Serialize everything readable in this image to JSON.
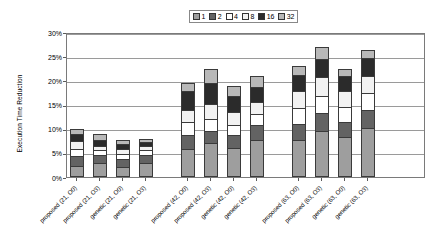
{
  "chart_data": {
    "type": "bar",
    "subtype": "stacked-bar",
    "title": "",
    "xlabel": "",
    "ylabel": "Execution Time Reduction",
    "ylim": [
      0,
      30
    ],
    "ytick_labels": [
      "0%",
      "5%",
      "10%",
      "15%",
      "20%",
      "25%",
      "30%"
    ],
    "ytick_values": [
      0,
      5,
      10,
      15,
      20,
      25,
      30
    ],
    "grid": true,
    "legend_position": "top-center",
    "legend_title": "",
    "series": [
      {
        "name": "1",
        "color": "#9e9e9e",
        "values": [
          2.2,
          3.0,
          2.1,
          2.9,
          5.8,
          7.0,
          6.1,
          7.7,
          7.7,
          9.6,
          8.2,
          10.2
        ]
      },
      {
        "name": "2",
        "color": "#636363",
        "values": [
          2.1,
          1.5,
          1.7,
          1.6,
          2.9,
          2.5,
          2.6,
          3.1,
          3.3,
          3.6,
          3.2,
          3.6
        ]
      },
      {
        "name": "4",
        "color": "#ffffff",
        "values": [
          1.6,
          1.0,
          1.0,
          1.0,
          2.7,
          2.5,
          2.1,
          2.3,
          3.3,
          3.6,
          3.0,
          3.5
        ]
      },
      {
        "name": "8",
        "color": "#f2f2f2",
        "values": [
          1.5,
          1.0,
          1.0,
          0.9,
          2.5,
          3.1,
          2.6,
          2.5,
          3.5,
          3.9,
          3.3,
          3.6
        ]
      },
      {
        "name": "16",
        "color": "#2b2b2b",
        "values": [
          1.6,
          1.1,
          1.0,
          0.9,
          3.8,
          4.3,
          3.4,
          3.1,
          3.4,
          3.8,
          3.2,
          3.7
        ]
      },
      {
        "name": "32",
        "color": "#b8b8b8",
        "values": [
          0.9,
          1.3,
          0.8,
          0.6,
          1.7,
          2.9,
          2.1,
          2.2,
          1.7,
          2.4,
          1.5,
          1.6
        ]
      }
    ],
    "categories": [
      "proposed (21, O0)",
      "proposed (21, O3)",
      "genetic (21, O0)",
      "genetic (21, O3)",
      "proposed (42, O0)",
      "proposed (42, O3)",
      "genetic (42, O0)",
      "genetic (42, O3)",
      "proposed (63, O0)",
      "proposed (63, O3)",
      "genetic (63, O0)",
      "genetic (63, O3)"
    ],
    "totals": [
      9.9,
      8.9,
      7.6,
      7.9,
      19.4,
      22.3,
      18.9,
      20.9,
      22.9,
      26.9,
      22.4,
      26.2
    ],
    "bar_x": [
      69,
      92,
      115,
      138,
      180,
      203,
      226,
      249,
      291,
      314,
      337,
      360
    ],
    "colors": {
      "axis": "#7a7a7a",
      "grid": "#9a9a9a",
      "background": "#ffffff",
      "text": "#000000"
    }
  },
  "legend": {
    "entries": [
      {
        "label": "1",
        "color": "#9e9e9e"
      },
      {
        "label": "2",
        "color": "#636363"
      },
      {
        "label": "4",
        "color": "#ffffff"
      },
      {
        "label": "8",
        "color": "#f2f2f2"
      },
      {
        "label": "16",
        "color": "#2b2b2b"
      },
      {
        "label": "32",
        "color": "#b8b8b8"
      }
    ]
  },
  "axis": {
    "y_title": "Execution Time Reduction"
  }
}
